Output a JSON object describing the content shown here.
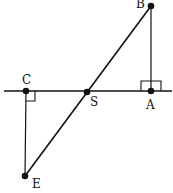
{
  "diagram": {
    "type": "geometry",
    "points": [
      {
        "name": "B",
        "label": "B",
        "x": 151,
        "y": 6
      },
      {
        "name": "A",
        "label": "A",
        "x": 151,
        "y": 91
      },
      {
        "name": "C",
        "label": "C",
        "x": 26,
        "y": 91
      },
      {
        "name": "S",
        "label": "S",
        "x": 87,
        "y": 92
      },
      {
        "name": "E",
        "label": "E",
        "x": 25,
        "y": 176
      }
    ],
    "segments": [
      {
        "from": "B",
        "to": "E",
        "note": "line BE through S"
      },
      {
        "from": "B",
        "to": "A"
      },
      {
        "from": "C",
        "to": "E"
      },
      {
        "note": "horizontal line through C, S, A"
      }
    ],
    "right_angles": [
      "A",
      "C"
    ],
    "colors": {
      "stroke": "#111111",
      "background": "#ffffff"
    }
  }
}
